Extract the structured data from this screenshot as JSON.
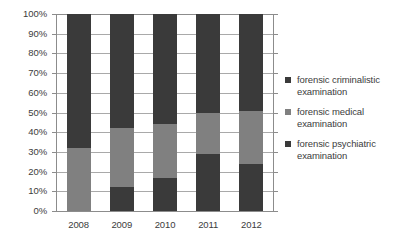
{
  "chart_data": {
    "type": "bar",
    "subtype": "100% stacked column",
    "title": "",
    "xlabel": "",
    "ylabel": "",
    "categories": [
      "2008",
      "2009",
      "2010",
      "2011",
      "2012"
    ],
    "ylim": [
      0,
      100
    ],
    "y_ticks": [
      0,
      10,
      20,
      30,
      40,
      50,
      60,
      70,
      80,
      90,
      100
    ],
    "y_tick_labels": [
      "0%",
      "10%",
      "20%",
      "30%",
      "40%",
      "50%",
      "60%",
      "70%",
      "80%",
      "90%",
      "100%"
    ],
    "grid": true,
    "grid_axis": "y",
    "legend_position": "right",
    "stack_order_bottom_to_top": [
      "forensic psychiatric examination",
      "forensic medical examination",
      "forensic criminalistic examination"
    ],
    "series": [
      {
        "name": "forensic criminalistic examination",
        "color": "#3a3a3a",
        "values": [
          68,
          58,
          56,
          50,
          49
        ]
      },
      {
        "name": "forensic medical examination",
        "color": "#808080",
        "values": [
          32,
          30,
          27,
          21,
          27
        ]
      },
      {
        "name": "forensic psychiatric examination",
        "color": "#3a3a3a",
        "values": [
          0,
          12,
          17,
          29,
          24
        ]
      }
    ]
  },
  "legend": {
    "entries": [
      {
        "label": "forensic criminalistic examination",
        "line1": "forensic criminalistic",
        "line2": "examination",
        "color": "#3a3a3a",
        "swatch_name": "legend-swatch-criminalistic"
      },
      {
        "label": "forensic medical examination",
        "line1": "forensic medical",
        "line2": "examination",
        "color": "#808080",
        "swatch_name": "legend-swatch-medical"
      },
      {
        "label": "forensic psychiatric examination",
        "line1": "forensic psychiatric",
        "line2": "examination",
        "color": "#3a3a3a",
        "swatch_name": "legend-swatch-psychiatric"
      }
    ]
  },
  "colors": {
    "criminalistic": "#3a3a3a",
    "medical": "#808080",
    "psychiatric": "#3a3a3a",
    "gridline": "#a9a9a9",
    "axis": "#8c8c8c",
    "text": "#3c3c3c",
    "background": "#ffffff"
  }
}
